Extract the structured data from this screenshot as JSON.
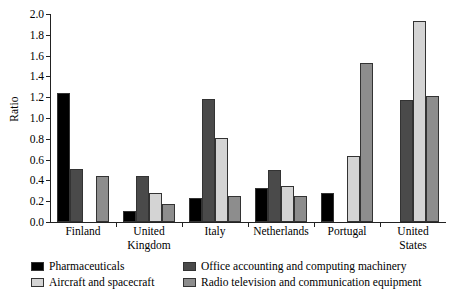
{
  "chart_data": {
    "type": "bar",
    "title": "",
    "xlabel": "",
    "ylabel": "Ratio",
    "ylim": [
      0.0,
      2.0
    ],
    "ytick_step": 0.2,
    "grid": false,
    "legend_position": "bottom",
    "categories": [
      "Finland",
      "United\nKingdom",
      "Italy",
      "Netherlands",
      "Portugal",
      "United\nStates"
    ],
    "ytick_labels": [
      "0.0",
      "0.2",
      "0.4",
      "0.6",
      "0.8",
      "1.0",
      "1.2",
      "1.4",
      "1.6",
      "1.8",
      "2.0"
    ],
    "series": [
      {
        "name": "Pharmaceuticals",
        "color": "#000000",
        "values": [
          1.24,
          0.11,
          0.23,
          0.33,
          0.28,
          0.0
        ]
      },
      {
        "name": "Office accounting and computing machinery",
        "color": "#4a4a4a",
        "values": [
          0.51,
          0.44,
          1.18,
          0.5,
          0.0,
          1.17
        ]
      },
      {
        "name": "Aircraft and spacecraft",
        "color": "#d4d4d4",
        "values": [
          0.0,
          0.28,
          0.81,
          0.35,
          0.63,
          1.93
        ]
      },
      {
        "name": "Radio television and communication equipment",
        "color": "#8d8d8d",
        "values": [
          0.44,
          0.17,
          0.25,
          0.25,
          1.53,
          1.21
        ]
      }
    ]
  }
}
